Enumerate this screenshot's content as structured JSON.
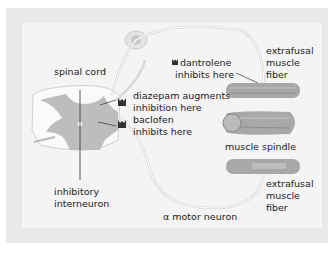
{
  "diagram": {
    "labels": {
      "spinal_cord": "spinal cord",
      "diazepam_1": "diazepam augments",
      "diazepam_2": "inhibition here",
      "baclofen_1": "baclofen",
      "baclofen_2": "inhibits here",
      "dantrolene_1": "dantrolene",
      "dantrolene_2": "inhibits here",
      "extrafusal_top_1": "extrafusal",
      "extrafusal_top_2": "muscle",
      "extrafusal_top_3": "fiber",
      "muscle_spindle": "muscle spindle",
      "extrafusal_bottom_1": "extrafusal",
      "extrafusal_bottom_2": "muscle",
      "extrafusal_bottom_3": "fiber",
      "inhibitory_1": "inhibitory",
      "inhibitory_2": "interneuron",
      "alpha_motor": "α motor neuron"
    },
    "colors": {
      "outer_bg": "#e9e9e9",
      "inner_bg": "#f4f4f4",
      "grey_matter": "#bdbdbd",
      "white_matter": "#fafafa",
      "muscle": "#a8a8a8",
      "drug_icon": "#333333"
    }
  }
}
